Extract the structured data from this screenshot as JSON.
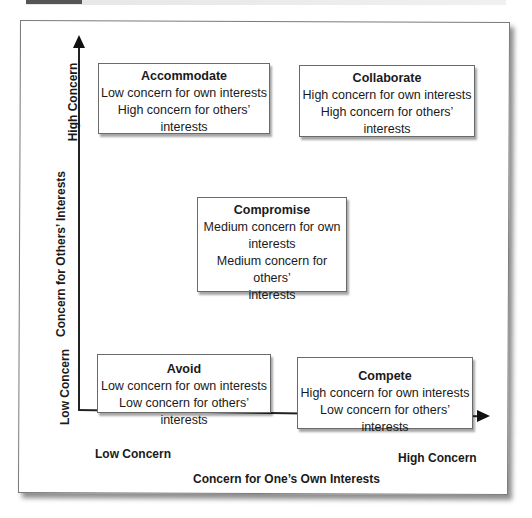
{
  "diagram": {
    "type": "conflict-management-grid",
    "x_axis": {
      "title": "Concern for One’s Own Interests",
      "low_label": "Low Concern",
      "high_label": "High Concern"
    },
    "y_axis": {
      "title": "Concern for Others’ Interests",
      "low_label": "Low Concern",
      "high_label": "High Concern"
    },
    "boxes": {
      "accommodate": {
        "title": "Accommodate",
        "lines": [
          "Low concern for own interests",
          "High concern for others’",
          "interests"
        ]
      },
      "collaborate": {
        "title": "Collaborate",
        "lines": [
          "High concern for own interests",
          "High concern for others’",
          "interests"
        ]
      },
      "compromise": {
        "title": "Compromise",
        "lines": [
          "Medium concern for own",
          "interests",
          "Medium concern for others’",
          "interests"
        ]
      },
      "avoid": {
        "title": "Avoid",
        "lines": [
          "Low concern for own interests",
          "Low concern for others’ interests"
        ]
      },
      "compete": {
        "title": "Compete",
        "lines": [
          "High concern for own interests",
          "Low concern for others’ interests"
        ]
      }
    }
  }
}
